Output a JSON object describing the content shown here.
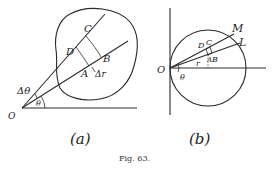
{
  "figure": {
    "caption": "Fig. 63.",
    "panels": [
      {
        "id": "a",
        "label": "(a)",
        "points": {
          "O": "O",
          "A": "A",
          "B": "B",
          "C": "C",
          "D": "D"
        },
        "symbols": {
          "delta_theta": "Δθ",
          "theta": "θ",
          "delta_r": "Δr"
        }
      },
      {
        "id": "b",
        "label": "(b)",
        "points": {
          "O": "O",
          "A": "A",
          "B": "B",
          "C": "C",
          "D": "D",
          "M": "M",
          "L": "L"
        },
        "symbols": {
          "theta": "θ",
          "r": "r"
        }
      }
    ]
  }
}
